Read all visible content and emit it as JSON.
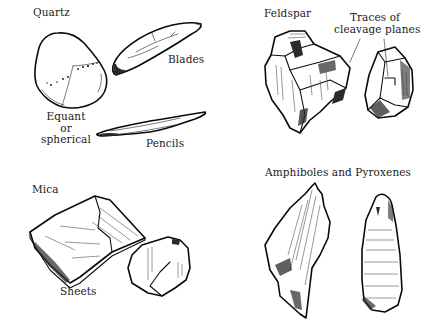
{
  "figure": {
    "panels": [
      {
        "title": "Quartz",
        "specimens": [
          "Equant or spherical",
          "Blades",
          "Pencils"
        ],
        "labels": {
          "equant_line1": "Equant",
          "equant_line2": "or",
          "equant_line3": "spherical",
          "blades": "Blades",
          "pencils": "Pencils"
        }
      },
      {
        "title": "Feldspar",
        "labels": {
          "cleavage_line1": "Traces of",
          "cleavage_line2": "cleavage planes"
        }
      },
      {
        "title": "Mica",
        "labels": {
          "sheets": "Sheets"
        }
      },
      {
        "title": "Amphiboles and Pyroxenes",
        "labels": {}
      }
    ]
  }
}
